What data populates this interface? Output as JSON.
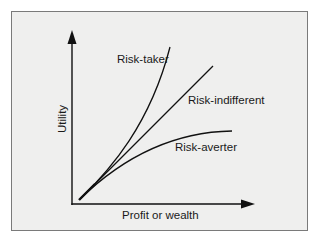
{
  "diagram": {
    "type": "utility-curves",
    "y_axis_label": "Utility",
    "x_axis_label": "Profit or wealth",
    "curves": [
      {
        "name": "Risk-taker",
        "shape": "convex"
      },
      {
        "name": "Risk-indifferent",
        "shape": "linear"
      },
      {
        "name": "Risk-averter",
        "shape": "concave"
      }
    ],
    "colors": {
      "panel_bg": "#efefee",
      "panel_border": "#7a7a7a",
      "ink": "#111111"
    }
  }
}
